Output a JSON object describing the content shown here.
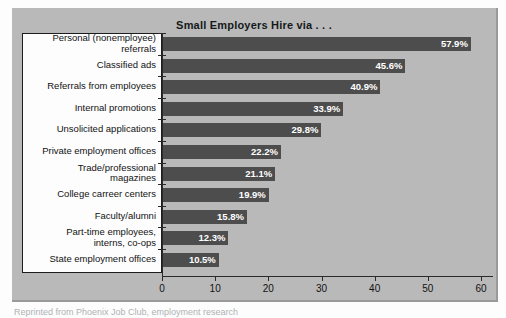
{
  "chart_data": {
    "type": "bar",
    "orientation": "horizontal",
    "title": "Small Employers Hire via . . .",
    "xlabel": "",
    "ylabel": "",
    "xlim": [
      0,
      60
    ],
    "xticks": [
      0,
      10,
      20,
      30,
      40,
      50,
      60
    ],
    "xtick_labels": [
      "0",
      "10",
      "20",
      "30",
      "40",
      "50",
      "60"
    ],
    "grid": false,
    "legend": null,
    "value_suffix": "%",
    "categories": [
      "Personal (nonemployee)\nreferrals",
      "Classified ads",
      "Referrals from employees",
      "Internal promotions",
      "Unsolicited applications",
      "Private employment offices",
      "Trade/professional\nmagazines",
      "College carreer centers",
      "Faculty/alumni",
      "Part-time employees,\ninterns, co-ops",
      "State employment offices"
    ],
    "values": [
      57.9,
      45.6,
      40.9,
      33.9,
      29.8,
      22.2,
      21.1,
      19.9,
      15.8,
      12.3,
      10.5
    ],
    "data_labels": [
      "57.9%",
      "45.6%",
      "40.9%",
      "33.9%",
      "29.8%",
      "22.2%",
      "21.1%",
      "19.9%",
      "15.8%",
      "12.3%",
      "10.5%"
    ],
    "colors": {
      "bar": "#4d4d4d",
      "panel": "#b9b9b9",
      "label_box": "#fdfdfd",
      "axis": "#2a2a2a",
      "text": "#121212",
      "data_label_text": "#ffffff"
    }
  },
  "caption": {
    "text": "Reprinted from Phoenix Job Club, employment research"
  }
}
